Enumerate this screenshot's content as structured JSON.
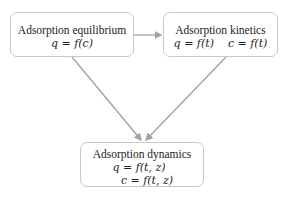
{
  "diagram": {
    "nodes": [
      {
        "id": "equilibrium",
        "title": "Adsorption equilibrium",
        "eq1": "q = f(c)"
      },
      {
        "id": "kinetics",
        "title": "Adsorption kinetics",
        "eq1": "q = f(t)    c = f(t)"
      },
      {
        "id": "dynamics",
        "title": "Adsorption dynamics",
        "eq1": "q = f(t, z)",
        "eq2": "c = f(t, z)"
      }
    ],
    "edges": [
      {
        "from": "equilibrium",
        "to": "kinetics"
      },
      {
        "from": "equilibrium",
        "to": "dynamics"
      },
      {
        "from": "kinetics",
        "to": "dynamics"
      }
    ],
    "colors": {
      "arrow": "#a0a0a0",
      "border": "#c8c8c8"
    }
  }
}
